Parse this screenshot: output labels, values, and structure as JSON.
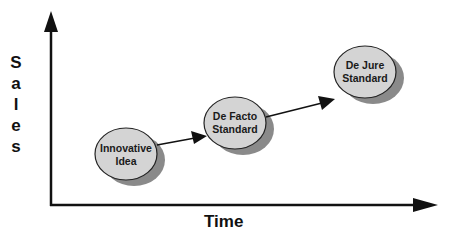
{
  "diagram": {
    "y_axis_label": "Sales",
    "y_axis_letters": [
      "S",
      "a",
      "l",
      "e",
      "s"
    ],
    "x_axis_label": "Time",
    "colors": {
      "node_fill": "#d4d4d4",
      "node_shadow": "#8a8a8a",
      "line": "#111111"
    },
    "nodes": [
      {
        "id": "innovative-idea",
        "line1": "Innovative",
        "line2": "Idea"
      },
      {
        "id": "de-facto-standard",
        "line1": "De Facto",
        "line2": "Standard"
      },
      {
        "id": "de-jure-standard",
        "line1": "De Jure",
        "line2": "Standard"
      }
    ],
    "edges": [
      {
        "from": "innovative-idea",
        "to": "de-facto-standard"
      },
      {
        "from": "de-facto-standard",
        "to": "de-jure-standard"
      }
    ]
  }
}
